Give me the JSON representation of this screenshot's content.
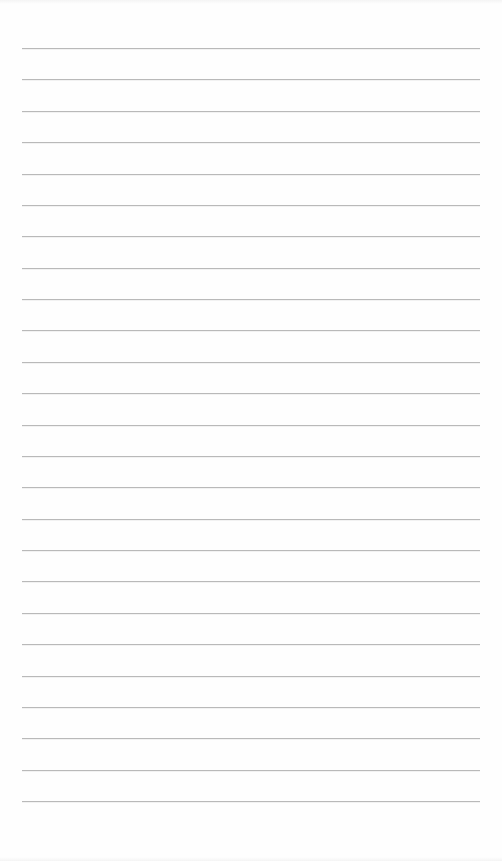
{
  "page": {
    "type": "lined-paper",
    "background_color": "#fefefe",
    "line_color": "#b9b9b9",
    "line_count": 25,
    "first_line_y": 48,
    "line_spacing": 31.375,
    "line_left": 22,
    "line_width": 458
  }
}
